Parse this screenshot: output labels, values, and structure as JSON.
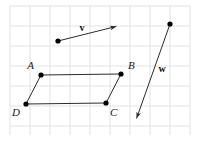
{
  "figure": {
    "width": 198,
    "height": 148,
    "background_color": "#ffffff"
  },
  "grid": {
    "name": "graph-paper-grid",
    "line_color": "#e3e3e6",
    "spacing": 20,
    "x_start": 10,
    "x_end": 190,
    "y_start": 6,
    "y_end": 135,
    "visible": true
  },
  "style": {
    "stroke_color": "#2b2b2b",
    "dot_color": "#000000",
    "stroke_width": 1,
    "dot_radius": 2.6
  },
  "vectors": [
    {
      "name": "vector-v",
      "label": "v",
      "label_x": 82,
      "label_y": 31,
      "tail_x": 58,
      "tail_y": 41,
      "head_x": 118,
      "head_y": 26,
      "has_tail_dot": true,
      "has_arrowhead": true
    },
    {
      "name": "vector-w",
      "label": "w",
      "label_x": 162,
      "label_y": 72,
      "tail_x": 170,
      "tail_y": 24,
      "head_x": 136,
      "head_y": 120,
      "has_tail_dot": true,
      "has_arrowhead": true
    }
  ],
  "parallelogram": {
    "name": "parallelogram-ABCD",
    "vertices": [
      {
        "label": "A",
        "x": 41,
        "y": 75,
        "label_x": 34,
        "label_y": 69,
        "label_anchor": "end"
      },
      {
        "label": "B",
        "x": 121,
        "y": 74,
        "label_x": 128,
        "label_y": 69,
        "label_anchor": "start"
      },
      {
        "label": "C",
        "x": 106,
        "y": 103,
        "label_x": 110,
        "label_y": 116,
        "label_anchor": "start"
      },
      {
        "label": "D",
        "x": 26,
        "y": 104,
        "label_x": 20,
        "label_y": 116,
        "label_anchor": "end"
      }
    ],
    "edges": [
      {
        "name": "edge-AB",
        "from": "A",
        "to": "B"
      },
      {
        "name": "edge-BC",
        "from": "B",
        "to": "C"
      },
      {
        "name": "edge-CD",
        "from": "C",
        "to": "D"
      },
      {
        "name": "edge-DA",
        "from": "D",
        "to": "A"
      }
    ]
  }
}
